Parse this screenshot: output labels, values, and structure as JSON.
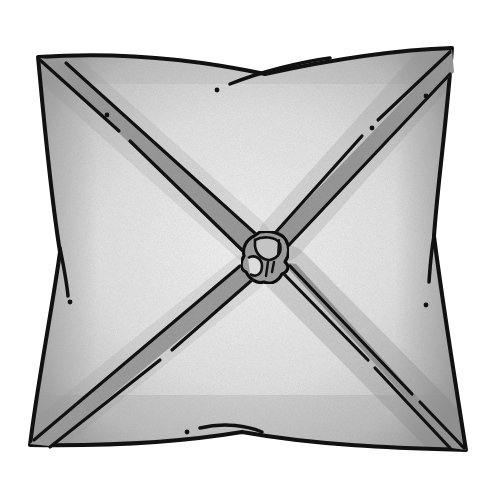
{
  "image": {
    "subject": "Square pillow with diagonal cross straps tied in a center knot",
    "style": "hand-drawn pencil shaded illustration",
    "width": 495,
    "height": 485
  },
  "colors": {
    "background": "#ffffff",
    "outline": "#111111",
    "pillow_light": "#efefef",
    "pillow_mid": "#d6d6d6",
    "pillow_shadow": "#a9a9a9",
    "strap_fill": "#9c9c9c",
    "strap_shadow": "#7e7e7e",
    "knot_fill": "#a3a3a3",
    "knot_highlight": "#dcdcdc"
  },
  "pillow": {
    "corners": {
      "top_left": [
        38,
        57
      ],
      "top_right": [
        452,
        48
      ],
      "bottom_right": [
        466,
        450
      ],
      "bottom_left": [
        30,
        445
      ]
    }
  },
  "straps": [
    {
      "name": "top-left-strap",
      "from": [
        40,
        58
      ],
      "to": [
        250,
        246
      ]
    },
    {
      "name": "top-right-strap",
      "from": [
        450,
        50
      ],
      "to": [
        282,
        240
      ]
    },
    {
      "name": "bottom-left-strap",
      "from": [
        32,
        444
      ],
      "to": [
        246,
        272
      ]
    },
    {
      "name": "bottom-right-strap",
      "from": [
        464,
        448
      ],
      "to": [
        284,
        268
      ]
    }
  ],
  "knot": {
    "center": [
      263,
      258
    ]
  },
  "stitch_dots": [
    [
      217,
      90
    ],
    [
      107,
      115
    ],
    [
      372,
      128
    ],
    [
      70,
      302
    ],
    [
      426,
      305
    ],
    [
      187,
      432
    ],
    [
      426,
      96
    ]
  ]
}
